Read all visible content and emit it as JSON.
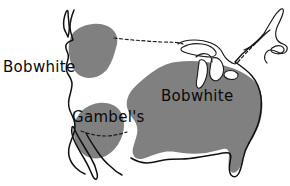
{
  "figure": {
    "name": "quail-range-map",
    "kind": "distribution-range-map",
    "region": "North America (United States, southern Canada, northern Mexico)",
    "background_color": "#ffffff",
    "range_fill_color": "#808080",
    "outline_color": "#111111",
    "label_text_color": "#0a0a0a"
  },
  "labels": {
    "bobwhite_west": "Bobwhite",
    "bobwhite_east": "Bobwhite",
    "gambels": "Gambel's"
  },
  "ranges": [
    {
      "id": "bobwhite-northwest",
      "species_label": "Bobwhite",
      "fill": "#808080",
      "location": "Pacific Northwest / Columbia Basin (introduced population)"
    },
    {
      "id": "bobwhite-east",
      "species_label": "Bobwhite",
      "fill": "#808080",
      "location": "Eastern and central United States, Great Plains to Atlantic coast and Florida"
    },
    {
      "id": "gambels-southwest",
      "species_label": "Gambel's",
      "fill": "#808080",
      "location": "Desert southwest: Arizona, southern Nevada, southeastern California, northwestern Mexico"
    }
  ],
  "borders": [
    {
      "id": "us-canada-border",
      "style": "dashed",
      "label": "United States – Canada border"
    },
    {
      "id": "us-mexico-border",
      "style": "dashed",
      "label": "United States – Mexico border"
    }
  ]
}
